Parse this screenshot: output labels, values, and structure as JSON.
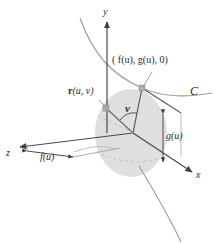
{
  "figure": {
    "background_color": "#ffffff",
    "width": 215,
    "height": 243
  },
  "colors": {
    "axis": "#4a4a4a",
    "curve": "#9a9a9a",
    "disk_fill": "#d8d8d8",
    "line": "#555555",
    "dashed": "#b0b0b0",
    "text": "#2b2b2b",
    "marker": "#9e9e9e"
  },
  "axes": [
    {
      "id": "y",
      "label": "y",
      "x": 104,
      "y": 12
    },
    {
      "id": "x",
      "label": "x",
      "x": 197,
      "y": 176
    },
    {
      "id": "z",
      "label": "z",
      "x": 8,
      "y": 155
    }
  ],
  "labels": {
    "point": "( f(u), g(u), 0)",
    "point_x": 113,
    "point_y": 60,
    "vector": "r(u, v)",
    "vector_bold_part": "r",
    "vector_rest": "(u, v)",
    "vector_x": 71,
    "vector_y": 92,
    "angle": "v",
    "angle_x": 126,
    "angle_y": 108,
    "curve": "C",
    "curve_x": 192,
    "curve_y": 91,
    "f_of_u": "f(u)",
    "f_of_u_x": 41,
    "f_of_u_y": 158,
    "g_of_u": "g(u)",
    "g_of_u_x": 167,
    "g_of_u_y": 137
  },
  "geometry": {
    "origin": {
      "x": 133,
      "y": 133
    },
    "point_on_curve": {
      "x": 142,
      "y": 88
    },
    "r_tip": {
      "x": 106,
      "y": 108
    },
    "disk": {
      "cx": 131,
      "cy": 133,
      "rx": 36,
      "ry": 44
    }
  },
  "annotations": {
    "dimension_f_label": "f(u)",
    "dimension_g_label": "g(u)",
    "angle_symbol": "v",
    "curve_name": "C"
  }
}
